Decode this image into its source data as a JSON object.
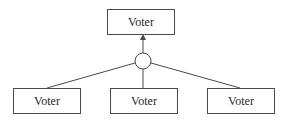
{
  "diagram": {
    "type": "aggregation-tree",
    "colors": {
      "stroke": "#4a4a4a",
      "text": "#2a2a2a",
      "background": "#ffffff"
    },
    "top_node": {
      "label": "Voter"
    },
    "connector": {
      "shape": "circle"
    },
    "bottom_nodes": [
      {
        "label": "Voter"
      },
      {
        "label": "Voter"
      },
      {
        "label": "Voter"
      }
    ],
    "edges": [
      {
        "from": "bottom_nodes.0",
        "to": "connector"
      },
      {
        "from": "bottom_nodes.1",
        "to": "connector"
      },
      {
        "from": "bottom_nodes.2",
        "to": "connector"
      },
      {
        "from": "connector",
        "to": "top_node",
        "arrow": true
      }
    ]
  }
}
